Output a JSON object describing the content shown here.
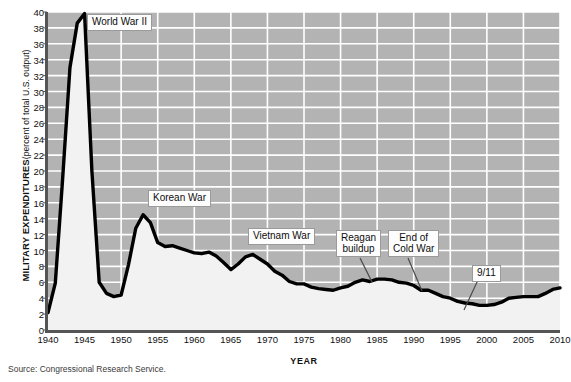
{
  "figure": {
    "source_note": "Source: Congressional Research Service."
  },
  "chart_data": {
    "type": "area",
    "title": "",
    "xlabel": "YEAR",
    "ylabel": "MILITARY EXPENDITURES (percent of total U.S. output)",
    "ylabel_main": "MILITARY EXPENDITURES",
    "ylabel_sub": "(percent of total U.S. output)",
    "xlim": [
      1940,
      2010
    ],
    "ylim": [
      0,
      40
    ],
    "grid": true,
    "legend": "none",
    "x_ticks": [
      1940,
      1945,
      1950,
      1955,
      1960,
      1965,
      1970,
      1975,
      1980,
      1985,
      1990,
      1995,
      2000,
      2005,
      2010
    ],
    "y_ticks": [
      0,
      2,
      4,
      6,
      8,
      10,
      12,
      14,
      16,
      18,
      20,
      22,
      24,
      26,
      28,
      30,
      32,
      34,
      36,
      38,
      40
    ],
    "series_name": "Military expenditures as percent of total U.S. output",
    "x": [
      1940,
      1941,
      1942,
      1943,
      1944,
      1945,
      1946,
      1947,
      1948,
      1949,
      1950,
      1951,
      1952,
      1953,
      1954,
      1955,
      1956,
      1957,
      1958,
      1959,
      1960,
      1961,
      1962,
      1963,
      1964,
      1965,
      1966,
      1967,
      1968,
      1969,
      1970,
      1971,
      1972,
      1973,
      1974,
      1975,
      1976,
      1977,
      1978,
      1979,
      1980,
      1981,
      1982,
      1983,
      1984,
      1985,
      1986,
      1987,
      1988,
      1989,
      1990,
      1991,
      1992,
      1993,
      1994,
      1995,
      1996,
      1997,
      1998,
      1999,
      2000,
      2001,
      2002,
      2003,
      2004,
      2005,
      2006,
      2007,
      2008,
      2009,
      2010
    ],
    "y": [
      2.2,
      5.9,
      19.0,
      33.0,
      38.6,
      39.8,
      20.0,
      6.0,
      4.6,
      4.2,
      4.4,
      8.2,
      12.8,
      14.5,
      13.5,
      11.0,
      10.5,
      10.6,
      10.3,
      10.0,
      9.7,
      9.6,
      9.8,
      9.3,
      8.5,
      7.6,
      8.3,
      9.2,
      9.5,
      8.9,
      8.3,
      7.4,
      6.9,
      6.1,
      5.8,
      5.8,
      5.4,
      5.2,
      5.1,
      5.0,
      5.3,
      5.5,
      6.0,
      6.3,
      6.1,
      6.4,
      6.4,
      6.3,
      6.0,
      5.9,
      5.6,
      5.0,
      5.0,
      4.6,
      4.2,
      4.0,
      3.6,
      3.4,
      3.3,
      3.1,
      3.1,
      3.2,
      3.5,
      4.0,
      4.1,
      4.2,
      4.2,
      4.2,
      4.6,
      5.1,
      5.3
    ],
    "annotations": [
      {
        "id": "world-war-2",
        "label": "World War II",
        "lines": [
          "World War II"
        ],
        "box_x": 87,
        "box_y": 14,
        "leader": null
      },
      {
        "id": "korean-war",
        "label": "Korean War",
        "lines": [
          "Korean War"
        ],
        "box_x": 148,
        "box_y": 190,
        "leader": null
      },
      {
        "id": "vietnam-war",
        "label": "Vietnam War",
        "lines": [
          "Vietnam War"
        ],
        "box_x": 248,
        "box_y": 228,
        "leader": null
      },
      {
        "id": "reagan-buildup",
        "label": "Reagan buildup",
        "lines": [
          "Reagan",
          "buildup"
        ],
        "box_x": 336,
        "box_y": 230,
        "leader": {
          "x1": 360,
          "y1": 258,
          "x2": 372,
          "y2": 282
        }
      },
      {
        "id": "end-of-cold-war",
        "label": "End of Cold War",
        "lines": [
          "End of",
          "Cold War"
        ],
        "box_x": 388,
        "box_y": 230,
        "leader": {
          "x1": 408,
          "y1": 258,
          "x2": 422,
          "y2": 291
        }
      },
      {
        "id": "nine-eleven",
        "label": "9/11",
        "lines": [
          "9/11"
        ],
        "box_x": 472,
        "box_y": 265,
        "leader": {
          "x1": 478,
          "y1": 280,
          "x2": 464,
          "y2": 310
        }
      }
    ],
    "colors": {
      "plot_background": "#b3b3b3",
      "gridline": "#ffffff",
      "line": "#000000",
      "area_fill": "#f2f2f2",
      "axis": "#555555",
      "text": "#111111",
      "callout_background": "#fdfdfd",
      "callout_border": "#9a9a9a"
    }
  }
}
